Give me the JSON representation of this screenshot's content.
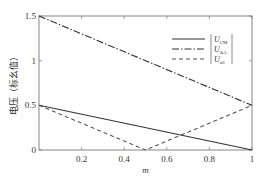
{
  "chart_data": {
    "type": "line",
    "title": "",
    "xlabel": "m",
    "ylabel": "电压（标幺值）",
    "xlim": [
      0,
      1
    ],
    "ylim": [
      0,
      1.5
    ],
    "x_ticks": [
      "0.2",
      "0.4",
      "0.6",
      "0.8",
      "1"
    ],
    "y_ticks": [
      "0",
      "0.5",
      "1",
      "1.5"
    ],
    "grid": false,
    "legend_position": "upper right",
    "series": [
      {
        "name": "|U_CM|",
        "label_main": "U",
        "label_sub": "CM",
        "style": "solid",
        "color": "#333333",
        "x": [
          0,
          1
        ],
        "values": [
          0.5,
          0
        ]
      },
      {
        "name": "|U_ΔA|",
        "label_main": "U",
        "label_sub": "ΔA",
        "style": "dash-dot",
        "color": "#333333",
        "x": [
          0,
          1
        ],
        "values": [
          1.5,
          0.5
        ]
      },
      {
        "name": "|U_a0|",
        "label_main": "U",
        "label_sub": "a0",
        "style": "dashed",
        "color": "#555555",
        "x": [
          0,
          0.5,
          1
        ],
        "values": [
          0.5,
          0,
          0.5
        ]
      }
    ]
  }
}
